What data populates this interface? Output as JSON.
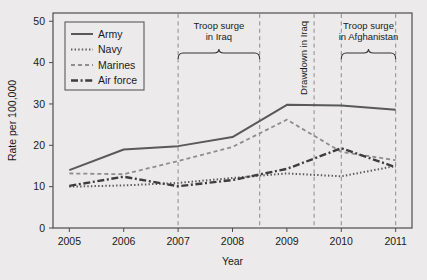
{
  "chart_data": {
    "type": "line",
    "title": "",
    "xlabel": "Year",
    "ylabel": "Rate per 100,000",
    "x": [
      2005,
      2006,
      2007,
      2008,
      2009,
      2010,
      2011
    ],
    "xlim": [
      2004.7,
      2011.3
    ],
    "ylim": [
      0,
      52
    ],
    "xticks": [
      2005,
      2006,
      2007,
      2008,
      2009,
      2010,
      2011
    ],
    "xticklabels": [
      "2005",
      "2006",
      "2007",
      "2008",
      "2009",
      "2010",
      "2011"
    ],
    "yticks": [
      0,
      10,
      20,
      30,
      40,
      50
    ],
    "yticklabels": [
      "0",
      "10",
      "20",
      "30",
      "40",
      "50"
    ],
    "grid": false,
    "legend_position": "upper left",
    "series": [
      {
        "name": "Army",
        "values": [
          14.0,
          19.0,
          19.8,
          22.0,
          29.8,
          29.6,
          28.6
        ],
        "style": "solid",
        "color": "#595959",
        "width": 2.0,
        "dasharray": ""
      },
      {
        "name": "Navy",
        "values": [
          10.0,
          10.3,
          10.9,
          12.1,
          13.2,
          12.5,
          15.0
        ],
        "style": "dotted",
        "color": "#595959",
        "width": 2.0,
        "dasharray": "1.4,2.2"
      },
      {
        "name": "Marines",
        "values": [
          13.2,
          13.0,
          16.2,
          19.6,
          26.2,
          18.4,
          16.4
        ],
        "style": "dashed",
        "color": "#8e8e8e",
        "width": 1.8,
        "dasharray": "4,3"
      },
      {
        "name": "Air force",
        "values": [
          10.2,
          12.4,
          10.1,
          11.6,
          14.3,
          19.3,
          14.7
        ],
        "style": "dashdot",
        "color": "#3d3d3d",
        "width": 2.4,
        "dasharray": "7,2.6,2,2.6"
      }
    ],
    "annotations": [
      {
        "id": "troop-surge-iraq",
        "lines": [
          "Troop surge",
          "in Iraq"
        ],
        "orientation": "horizontal",
        "brace_start": 2007.0,
        "brace_end": 2008.5
      },
      {
        "id": "drawdown-iraq",
        "lines": [
          "Drawdown in Iraq"
        ],
        "orientation": "vertical",
        "at": 2009.5
      },
      {
        "id": "troop-surge-afghanistan",
        "lines": [
          "Troop surge",
          "in Afghanistan"
        ],
        "orientation": "horizontal",
        "brace_start": 2010.0,
        "brace_end": 2011.0
      }
    ],
    "vlines": [
      2007.0,
      2008.5,
      2009.5,
      2010.0,
      2011.0
    ],
    "vline_color": "#8c8c8c"
  }
}
